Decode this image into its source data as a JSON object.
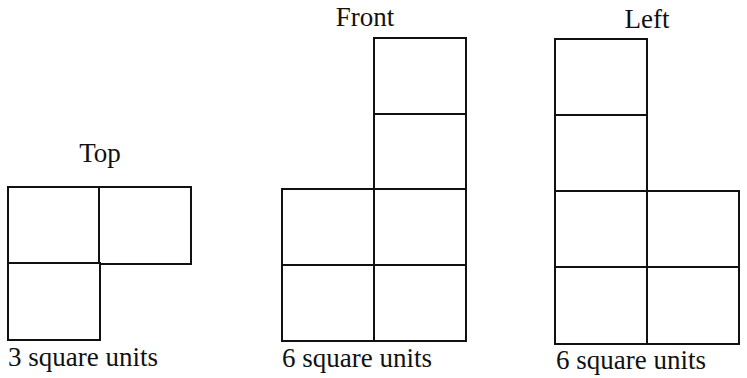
{
  "views": [
    {
      "id": "top",
      "title": "Top",
      "caption": "3 square units",
      "area": 3,
      "title_pos": {
        "x": 100,
        "y": 138
      },
      "caption_pos": {
        "x": 8,
        "y": 342
      },
      "origin": {
        "x": 8,
        "y": 187
      },
      "cell_size": {
        "w": 91,
        "h": 76
      },
      "cells": [
        [
          0,
          0
        ],
        [
          1,
          0
        ],
        [
          0,
          1
        ]
      ]
    },
    {
      "id": "front",
      "title": "Front",
      "caption": "6 square units",
      "area": 6,
      "title_pos": {
        "x": 365,
        "y": 2
      },
      "caption_pos": {
        "x": 282,
        "y": 343
      },
      "origin": {
        "x": 282,
        "y": 38
      },
      "cell_size": {
        "w": 91.5,
        "h": 75.5
      },
      "cells": [
        [
          1,
          0
        ],
        [
          1,
          1
        ],
        [
          0,
          2
        ],
        [
          1,
          2
        ],
        [
          0,
          3
        ],
        [
          1,
          3
        ]
      ]
    },
    {
      "id": "left",
      "title": "Left",
      "caption": "6 square units",
      "area": 6,
      "title_pos": {
        "x": 647,
        "y": 4
      },
      "caption_pos": {
        "x": 556,
        "y": 345
      },
      "origin": {
        "x": 555,
        "y": 39
      },
      "cell_size": {
        "w": 91.5,
        "h": 76
      },
      "cells": [
        [
          0,
          0
        ],
        [
          0,
          1
        ],
        [
          0,
          2
        ],
        [
          1,
          2
        ],
        [
          0,
          3
        ],
        [
          1,
          3
        ]
      ]
    }
  ],
  "colors": {
    "stroke": "#111111",
    "background": "#ffffff"
  }
}
